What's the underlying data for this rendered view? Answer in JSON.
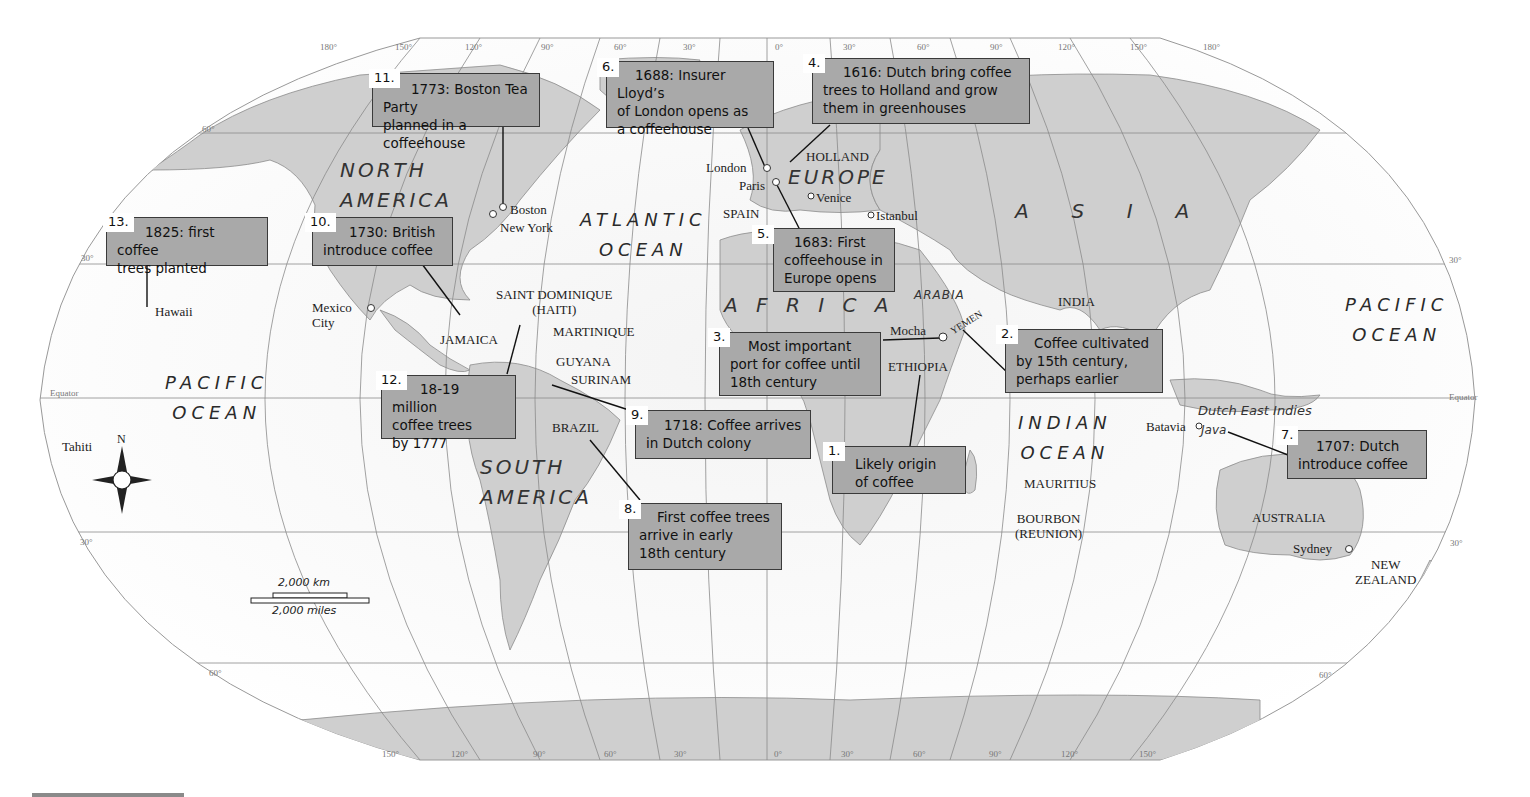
{
  "map": {
    "title": "Spread of coffee cultivation and coffeehouses",
    "callouts": [
      {
        "num": "1.",
        "text": "Likely origin\nof coffee"
      },
      {
        "num": "2.",
        "text": "Coffee cultivated\nby 15th century,\nperhaps earlier"
      },
      {
        "num": "3.",
        "text": "Most important\nport for coffee until\n18th century"
      },
      {
        "num": "4.",
        "text": "1616: Dutch bring coffee\ntrees to Holland and grow\nthem in greenhouses"
      },
      {
        "num": "5.",
        "text": "1683: First\ncoffeehouse in\nEurope opens"
      },
      {
        "num": "6.",
        "text": "1688: Insurer Lloyd’s\nof London opens as\na coffeehouse"
      },
      {
        "num": "7.",
        "text": "1707: Dutch\nintroduce coffee"
      },
      {
        "num": "8.",
        "text": "First coffee trees\narrive in early\n18th century"
      },
      {
        "num": "9.",
        "text": "1718: Coffee arrives\nin Dutch colony"
      },
      {
        "num": "10.",
        "text": "1730: British\nintroduce coffee"
      },
      {
        "num": "11.",
        "text": "1773: Boston Tea Party\nplanned in a coffeehouse"
      },
      {
        "num": "12.",
        "text": "18-19 million\ncoffee trees\nby 1777"
      },
      {
        "num": "13.",
        "text": "1825: first coffee\ntrees planted"
      }
    ],
    "continents": {
      "north_america": "NORTH\nAMERICA",
      "south_america": "SOUTH\nAMERICA",
      "europe": "EUROPE",
      "africa": "A F R I C A",
      "asia": "A  S  I  A",
      "arabia": "ARABIA",
      "dutch_east_indies": "Dutch East Indies",
      "java": "Java"
    },
    "oceans": {
      "atlantic": "ATLANTIC\nOCEAN",
      "pacific_west": "PACIFIC\nOCEAN",
      "pacific_east": "PACIFIC\nOCEAN",
      "indian": "INDIAN\nOCEAN"
    },
    "places": {
      "london": "London",
      "paris": "Paris",
      "holland": "HOLLAND",
      "venice": "Venice",
      "istanbul": "Istanbul",
      "spain": "SPAIN",
      "boston": "Boston",
      "new_york": "New York",
      "mexico_city": "Mexico\nCity",
      "hawaii": "Hawaii",
      "tahiti": "Tahiti",
      "jamaica": "JAMAICA",
      "saint_dominique": "SAINT DOMINIQUE\n(HAITI)",
      "martinique": "MARTINIQUE",
      "guyana": "GUYANA",
      "surinam": "SURINAM",
      "brazil": "BRAZIL",
      "mocha": "Mocha",
      "yemen": "YEMEN",
      "ethiopia": "ETHIOPIA",
      "india": "INDIA",
      "mauritius": "MAURITIUS",
      "bourbon": "BOURBON\n(REUNION)",
      "batavia": "Batavia",
      "australia": "AUSTRALIA",
      "sydney": "Sydney",
      "new_zealand": "NEW\nZEALAND"
    },
    "graticule": {
      "top_longitudes": [
        "180°",
        "150°",
        "120°",
        "90°",
        "60°",
        "30°",
        "0°",
        "30°",
        "60°",
        "90°",
        "120°",
        "150°",
        "180°"
      ],
      "bottom_longitudes": [
        "150°",
        "120°",
        "90°",
        "60°",
        "30°",
        "0°",
        "30°",
        "60°",
        "90°",
        "120°",
        "150°"
      ],
      "lat_60": "60°",
      "lat_30": "30°",
      "equator": "Equator"
    },
    "compass": {
      "north": "N"
    },
    "scale": {
      "km": "2,000 km",
      "miles": "2,000 miles"
    }
  }
}
